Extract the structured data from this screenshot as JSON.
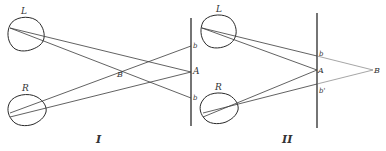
{
  "figure": {
    "panels": [
      {
        "id": "I",
        "numeral": "I",
        "eyes": {
          "left": "L",
          "right": "R"
        },
        "points": {
          "fixation": "A",
          "near_point": "B",
          "upper_image": "b",
          "lower_image": "b"
        }
      },
      {
        "id": "II",
        "numeral": "II",
        "eyes": {
          "left": "L",
          "right": "R"
        },
        "points": {
          "fixation": "A",
          "far_point": "B",
          "upper_image": "b",
          "lower_image": "b'"
        }
      }
    ]
  }
}
